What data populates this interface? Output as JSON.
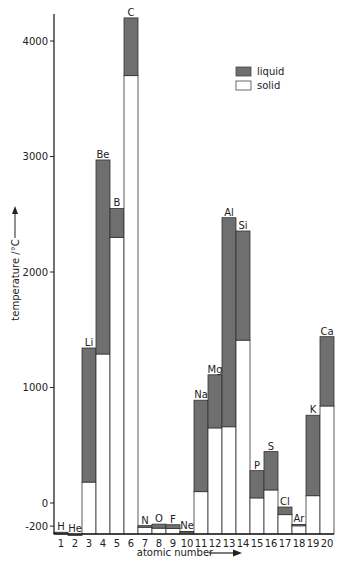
{
  "chart_data": {
    "type": "bar",
    "subtype": "floating-stacked",
    "title": "",
    "xlabel": "atomic number",
    "ylabel": "temperature /°C",
    "ylim": [
      -273,
      4250
    ],
    "yticks": [
      -200,
      0,
      1000,
      2000,
      3000,
      4000
    ],
    "grid": false,
    "legend": {
      "position": "top-right",
      "entries": [
        "liquid",
        "solid"
      ]
    },
    "colors": {
      "liquid": "#6f6f6f",
      "solid": "#ffffff",
      "outline": "#333333"
    },
    "categories": [
      "1",
      "2",
      "3",
      "4",
      "5",
      "6",
      "7",
      "8",
      "9",
      "10",
      "11",
      "12",
      "13",
      "14",
      "15",
      "16",
      "17",
      "18",
      "19",
      "20"
    ],
    "symbols": [
      "H",
      "He",
      "Li",
      "Be",
      "B",
      "C",
      "N",
      "O",
      "F",
      "Ne",
      "Na",
      "Mg",
      "Al",
      "Si",
      "P",
      "S",
      "Cl",
      "Ar",
      "K",
      "Ca"
    ],
    "series": [
      {
        "name": "melting point (top of solid)",
        "values": [
          -259,
          -272,
          181,
          1290,
          2300,
          3700,
          -210,
          -218,
          -220,
          -249,
          98,
          650,
          660,
          1410,
          44,
          113,
          -101,
          -189,
          63,
          840
        ]
      },
      {
        "name": "boiling point (top of liquid)",
        "values": [
          -253,
          -269,
          1342,
          2970,
          2550,
          4200,
          -196,
          -183,
          -188,
          -246,
          890,
          1110,
          2470,
          2355,
          280,
          445,
          -35,
          -186,
          760,
          1440
        ]
      }
    ],
    "baseline": -273
  },
  "axis": {
    "y_title": "temperature /°C",
    "x_title": "atomic number",
    "y_tick_labels": [
      "-200",
      "0",
      "1000",
      "2000",
      "3000",
      "4000"
    ]
  },
  "legend": {
    "liquid_label": "liquid",
    "solid_label": "solid"
  }
}
